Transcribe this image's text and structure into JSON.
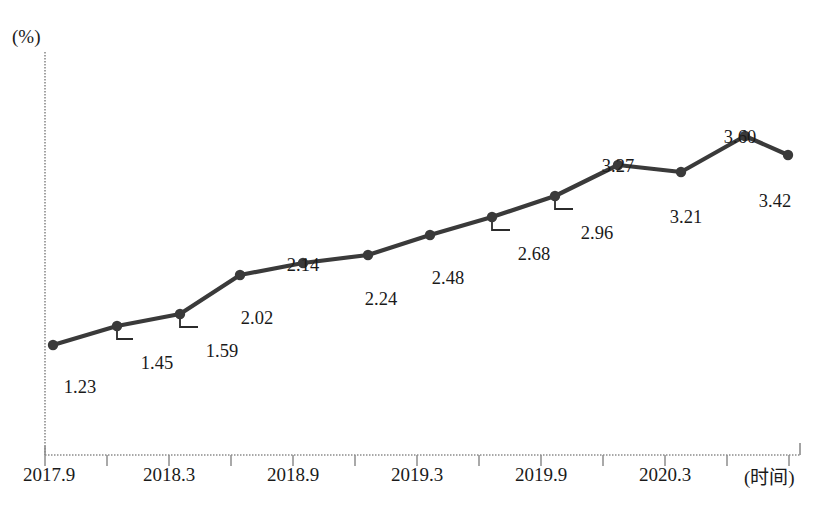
{
  "chart_data": {
    "type": "line",
    "title": "",
    "xlabel": "(时间)",
    "ylabel": "(%)",
    "grid": false,
    "legend": "none",
    "xlim": [
      0,
      13
    ],
    "ylim": [
      0,
      4.0
    ],
    "x": [
      "2017.9",
      "2017.12",
      "2018.3",
      "2018.6",
      "2018.9",
      "2018.12",
      "2019.3",
      "2019.6",
      "2019.9",
      "2019.12",
      "2020.3",
      "2020.6",
      "2020.9"
    ],
    "values": [
      1.23,
      1.45,
      1.59,
      2.02,
      2.14,
      2.24,
      2.48,
      2.68,
      2.96,
      3.27,
      3.21,
      3.6,
      3.42
    ],
    "point_labels": [
      "1.23",
      "1.45",
      "1.59",
      "2.02",
      "2.14",
      "2.24",
      "2.48",
      "2.68",
      "2.96",
      "3.27",
      "3.21",
      "3.60",
      "3.42"
    ],
    "tick_labels": [
      "2017.9",
      "2018.3",
      "2018.9",
      "2019.3",
      "2019.9",
      "2020.3"
    ],
    "series_color": "#3a3a3a",
    "axis_color": "#8c8c8c"
  },
  "axes": {
    "y_unit": "(%)",
    "x_unit": "(时间)"
  },
  "ticks": [
    {
      "label": "2017.9",
      "x": 45
    },
    {
      "label": "2018.3",
      "x": 169
    },
    {
      "label": "2018.9",
      "x": 293
    },
    {
      "label": "2019.3",
      "x": 417
    },
    {
      "label": "2019.9",
      "x": 541
    },
    {
      "label": "2020.3",
      "x": 665
    }
  ],
  "points": [
    {
      "label": "1.23",
      "px": 53,
      "py": 345,
      "lx": 80,
      "ly": 377,
      "leader": false
    },
    {
      "label": "1.45",
      "px": 117,
      "py": 326,
      "lx": 157,
      "ly": 353,
      "leader": true
    },
    {
      "label": "1.59",
      "px": 180,
      "py": 314,
      "lx": 222,
      "ly": 341,
      "leader": true
    },
    {
      "label": "2.02",
      "px": 240,
      "py": 275,
      "lx": 257,
      "ly": 308,
      "leader": false
    },
    {
      "label": "2.14",
      "px": 303,
      "py": 263,
      "lx": 303,
      "ly": 255,
      "leader": false
    },
    {
      "label": "2.24",
      "px": 368,
      "py": 255,
      "lx": 381,
      "ly": 289,
      "leader": false
    },
    {
      "label": "2.48",
      "px": 430,
      "py": 235,
      "lx": 448,
      "ly": 268,
      "leader": false
    },
    {
      "label": "2.68",
      "px": 492,
      "py": 217,
      "lx": 534,
      "ly": 244,
      "leader": true
    },
    {
      "label": "2.96",
      "px": 555,
      "py": 196,
      "lx": 597,
      "ly": 223,
      "leader": true
    },
    {
      "label": "3.27",
      "px": 618,
      "py": 165,
      "lx": 618,
      "ly": 156,
      "leader": false
    },
    {
      "label": "3.21",
      "px": 681,
      "py": 172,
      "lx": 686,
      "ly": 207,
      "leader": false
    },
    {
      "label": "3.60",
      "px": 745,
      "py": 136,
      "lx": 740,
      "ly": 127,
      "leader": false
    },
    {
      "label": "3.42",
      "px": 788,
      "py": 155,
      "lx": 775,
      "ly": 191,
      "leader": false
    }
  ],
  "caption": ""
}
